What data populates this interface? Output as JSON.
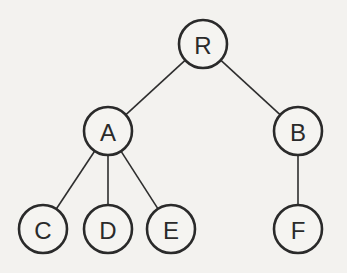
{
  "diagram": {
    "type": "tree",
    "colors": {
      "background": "#f3f2ef",
      "stroke": "#2a2a2a",
      "node_fill": "#f5f4f1"
    },
    "node_radius": 24,
    "nodes": [
      {
        "id": "R",
        "label": "R",
        "x": 203,
        "y": 44
      },
      {
        "id": "A",
        "label": "A",
        "x": 108,
        "y": 131
      },
      {
        "id": "B",
        "label": "B",
        "x": 298,
        "y": 131
      },
      {
        "id": "C",
        "label": "C",
        "x": 43,
        "y": 229
      },
      {
        "id": "D",
        "label": "D",
        "x": 108,
        "y": 229
      },
      {
        "id": "E",
        "label": "E",
        "x": 171,
        "y": 229
      },
      {
        "id": "F",
        "label": "F",
        "x": 298,
        "y": 229
      }
    ],
    "edges": [
      {
        "from": "R",
        "to": "A"
      },
      {
        "from": "R",
        "to": "B"
      },
      {
        "from": "A",
        "to": "C"
      },
      {
        "from": "A",
        "to": "D"
      },
      {
        "from": "A",
        "to": "E"
      },
      {
        "from": "B",
        "to": "F"
      }
    ]
  }
}
